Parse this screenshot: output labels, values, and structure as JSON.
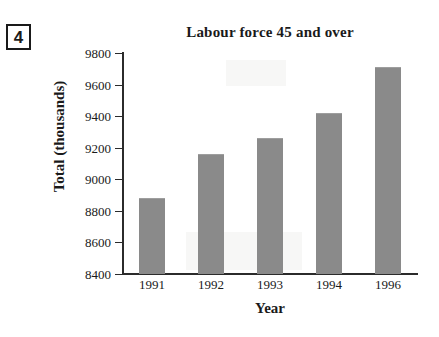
{
  "question": {
    "number": "4"
  },
  "chart_data": {
    "type": "bar",
    "title": "Labour force 45 and over",
    "xlabel": "Year",
    "ylabel": "Total (thousands)",
    "categories": [
      "1991",
      "1992",
      "1993",
      "1994",
      "1996"
    ],
    "values": [
      8880,
      9160,
      9260,
      9420,
      9710
    ],
    "ylim": [
      8400,
      9800
    ],
    "ytick_step": 200,
    "yticks": [
      "9800",
      "9600",
      "9400",
      "9200",
      "9000",
      "8800",
      "8600",
      "8400"
    ],
    "ytick_values": [
      9800,
      9600,
      9400,
      9200,
      9000,
      8800,
      8600,
      8400
    ],
    "grid": false,
    "legend": false,
    "bar_color": "#8a8a8a",
    "axis_color": "#2b2b2b"
  }
}
